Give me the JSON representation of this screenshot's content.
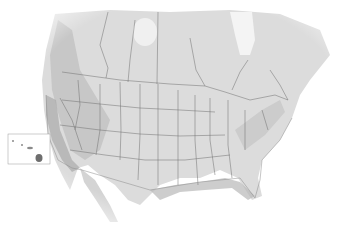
{
  "map": {
    "type": "shaded relief map",
    "region": "North America (United States and southern Canada)",
    "labels": [],
    "insets": [
      {
        "name": "Hawaii",
        "box": [
          8,
          134,
          50,
          54
        ]
      }
    ],
    "colors": {
      "background": "#ffffff",
      "land_light": "#e4e4e4",
      "land_mid": "#cfcfcf",
      "land_dark": "#b4b4b4",
      "coastal_dark": "#a8a8a8",
      "border": "#6e6e6e",
      "ice": "#f6f6f6"
    }
  }
}
